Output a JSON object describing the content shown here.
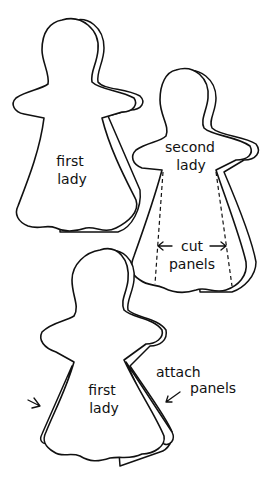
{
  "figures": {
    "top_left": {
      "label_line1": "first",
      "label_line2": "lady"
    },
    "top_right": {
      "label_line1": "second",
      "label_line2": "lady",
      "annotation_line1": "cut",
      "annotation_line2": "panels"
    },
    "bottom": {
      "label_line1": "first",
      "label_line2": "lady",
      "annotation_line1": "attach",
      "annotation_line2": "panels"
    }
  },
  "colors": {
    "ink": "#111111",
    "background": "#ffffff"
  }
}
